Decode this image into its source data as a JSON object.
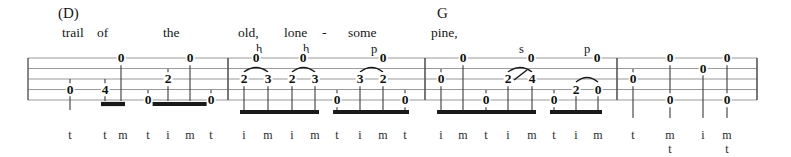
{
  "document": {
    "type": "banjo-tablature",
    "staff_lines": 5,
    "measures": 4,
    "staff": {
      "x_start": 28,
      "x_end": 757,
      "y_top": 58,
      "y_bottom": 100,
      "line_gap": 10.5
    },
    "barlines_x": [
      228,
      425,
      617
    ]
  },
  "chords": [
    {
      "label": "(D)",
      "x": 58,
      "y": 6
    },
    {
      "label": "G",
      "x": 437,
      "y": 6
    }
  ],
  "lyrics": [
    {
      "text": "trail",
      "x": 62,
      "y": 26
    },
    {
      "text": "of",
      "x": 97,
      "y": 26
    },
    {
      "text": "the",
      "x": 163,
      "y": 26
    },
    {
      "text": "old,",
      "x": 238,
      "y": 26
    },
    {
      "text": "lone",
      "x": 284,
      "y": 26
    },
    {
      "text": "-",
      "x": 322,
      "y": 26
    },
    {
      "text": "some",
      "x": 348,
      "y": 26
    },
    {
      "text": "pine,",
      "x": 431,
      "y": 26
    }
  ],
  "techniques": [
    {
      "symbol": "h",
      "x": 256,
      "y": 43
    },
    {
      "symbol": "h",
      "x": 303,
      "y": 43
    },
    {
      "symbol": "p",
      "x": 371,
      "y": 43
    },
    {
      "symbol": "s",
      "x": 519,
      "y": 43
    },
    {
      "symbol": "p",
      "x": 584,
      "y": 43
    }
  ],
  "notes": [
    {
      "fret": "0",
      "x": 70,
      "string": 4
    },
    {
      "fret": "4",
      "x": 105,
      "string": 4
    },
    {
      "fret": "0",
      "x": 121,
      "string": 1
    },
    {
      "fret": "0",
      "x": 148,
      "string": 5
    },
    {
      "fret": "2",
      "x": 168,
      "string": 3
    },
    {
      "fret": "0",
      "x": 190,
      "string": 1
    },
    {
      "fret": "0",
      "x": 211,
      "string": 5
    },
    {
      "fret": "2",
      "x": 244,
      "string": 3
    },
    {
      "fret": "3",
      "x": 268,
      "string": 3
    },
    {
      "fret": "0",
      "x": 256,
      "string": 1
    },
    {
      "fret": "2",
      "x": 292,
      "string": 3
    },
    {
      "fret": "3",
      "x": 315,
      "string": 3
    },
    {
      "fret": "0",
      "x": 303,
      "string": 1
    },
    {
      "fret": "0",
      "x": 337,
      "string": 5
    },
    {
      "fret": "3",
      "x": 360,
      "string": 3
    },
    {
      "fret": "2",
      "x": 383,
      "string": 3
    },
    {
      "fret": "0",
      "x": 383,
      "string": 1
    },
    {
      "fret": "0",
      "x": 405,
      "string": 5
    },
    {
      "fret": "0",
      "x": 441,
      "string": 3
    },
    {
      "fret": "0",
      "x": 463,
      "string": 1
    },
    {
      "fret": "0",
      "x": 486,
      "string": 5
    },
    {
      "fret": "2",
      "x": 508,
      "string": 3
    },
    {
      "fret": "4",
      "x": 532,
      "string": 3
    },
    {
      "fret": "0",
      "x": 531,
      "string": 1
    },
    {
      "fret": "0",
      "x": 554,
      "string": 5
    },
    {
      "fret": "2",
      "x": 576,
      "string": 4
    },
    {
      "fret": "0",
      "x": 598,
      "string": 4
    },
    {
      "fret": "0",
      "x": 597,
      "string": 1
    },
    {
      "fret": "0",
      "x": 633,
      "string": 3
    },
    {
      "fret": "0",
      "x": 670,
      "string": 1
    },
    {
      "fret": "0",
      "x": 670,
      "string": 5
    },
    {
      "fret": "0",
      "x": 703,
      "string": 2
    },
    {
      "fret": "0",
      "x": 727,
      "string": 1
    },
    {
      "fret": "0",
      "x": 727,
      "string": 5
    }
  ],
  "slurs": [
    {
      "x1": 244,
      "x2": 268,
      "y": 72,
      "kind": "hammer-on"
    },
    {
      "x1": 292,
      "x2": 315,
      "y": 72,
      "kind": "hammer-on"
    },
    {
      "x1": 360,
      "x2": 383,
      "y": 72,
      "kind": "pull-off"
    },
    {
      "x1": 508,
      "x2": 532,
      "y": 72,
      "kind": "slide"
    },
    {
      "x1": 576,
      "x2": 598,
      "y": 82,
      "kind": "pull-off"
    }
  ],
  "slide_line": {
    "x1": 514,
    "y1": 80,
    "x2": 527,
    "y2": 70
  },
  "stems": [
    {
      "x": 70,
      "y1": 79,
      "y2": 110
    },
    {
      "x": 105,
      "y1": 79,
      "y2": 101
    },
    {
      "x": 121,
      "y1": 58,
      "y2": 101
    },
    {
      "x": 148,
      "y1": 90,
      "y2": 101
    },
    {
      "x": 168,
      "y1": 69,
      "y2": 101
    },
    {
      "x": 190,
      "y1": 58,
      "y2": 101
    },
    {
      "x": 211,
      "y1": 90,
      "y2": 101
    },
    {
      "x": 244,
      "y1": 79,
      "y2": 111
    },
    {
      "x": 268,
      "y1": 79,
      "y2": 111
    },
    {
      "x": 292,
      "y1": 79,
      "y2": 111
    },
    {
      "x": 315,
      "y1": 79,
      "y2": 111
    },
    {
      "x": 337,
      "y1": 90,
      "y2": 111
    },
    {
      "x": 360,
      "y1": 79,
      "y2": 111
    },
    {
      "x": 383,
      "y1": 79,
      "y2": 111
    },
    {
      "x": 405,
      "y1": 90,
      "y2": 111
    },
    {
      "x": 441,
      "y1": 69,
      "y2": 111
    },
    {
      "x": 463,
      "y1": 58,
      "y2": 111
    },
    {
      "x": 486,
      "y1": 90,
      "y2": 111
    },
    {
      "x": 508,
      "y1": 79,
      "y2": 111
    },
    {
      "x": 532,
      "y1": 79,
      "y2": 111
    },
    {
      "x": 554,
      "y1": 90,
      "y2": 111
    },
    {
      "x": 576,
      "y1": 86,
      "y2": 111
    },
    {
      "x": 598,
      "y1": 86,
      "y2": 111
    },
    {
      "x": 633,
      "y1": 69,
      "y2": 118
    },
    {
      "x": 670,
      "y1": 58,
      "y2": 118
    },
    {
      "x": 703,
      "y1": 64,
      "y2": 118
    },
    {
      "x": 727,
      "y1": 58,
      "y2": 118
    }
  ],
  "beams": [
    {
      "x1": 101,
      "x2": 125,
      "y": 104
    },
    {
      "x1": 144,
      "x2": 215,
      "y": 104
    },
    {
      "x1": 240,
      "x2": 319,
      "y": 112
    },
    {
      "x1": 333,
      "x2": 409,
      "y": 112
    },
    {
      "x1": 437,
      "x2": 536,
      "y": 112
    },
    {
      "x1": 550,
      "x2": 602,
      "y": 112
    }
  ],
  "fingerings": [
    {
      "text": "t",
      "x": 70,
      "y": 129
    },
    {
      "text": "t",
      "x": 105,
      "y": 129
    },
    {
      "text": "m",
      "x": 123,
      "y": 129
    },
    {
      "text": "t",
      "x": 148,
      "y": 129
    },
    {
      "text": "i",
      "x": 168,
      "y": 129
    },
    {
      "text": "m",
      "x": 190,
      "y": 129
    },
    {
      "text": "t",
      "x": 211,
      "y": 129
    },
    {
      "text": "i",
      "x": 244,
      "y": 129
    },
    {
      "text": "m",
      "x": 268,
      "y": 129
    },
    {
      "text": "i",
      "x": 292,
      "y": 129
    },
    {
      "text": "m",
      "x": 315,
      "y": 129
    },
    {
      "text": "t",
      "x": 337,
      "y": 129
    },
    {
      "text": "i",
      "x": 360,
      "y": 129
    },
    {
      "text": "m",
      "x": 383,
      "y": 129
    },
    {
      "text": "t",
      "x": 405,
      "y": 129
    },
    {
      "text": "i",
      "x": 441,
      "y": 129
    },
    {
      "text": "m",
      "x": 463,
      "y": 129
    },
    {
      "text": "t",
      "x": 486,
      "y": 129
    },
    {
      "text": "i",
      "x": 508,
      "y": 129
    },
    {
      "text": "m",
      "x": 532,
      "y": 129
    },
    {
      "text": "t",
      "x": 554,
      "y": 129
    },
    {
      "text": "i",
      "x": 576,
      "y": 129
    },
    {
      "text": "m",
      "x": 598,
      "y": 129
    },
    {
      "text": "t",
      "x": 633,
      "y": 129
    },
    {
      "text": "m",
      "x": 670,
      "y": 129
    },
    {
      "text": "t",
      "x": 670,
      "y": 143
    },
    {
      "text": "i",
      "x": 703,
      "y": 129
    },
    {
      "text": "m",
      "x": 727,
      "y": 129
    },
    {
      "text": "t",
      "x": 727,
      "y": 143
    }
  ]
}
